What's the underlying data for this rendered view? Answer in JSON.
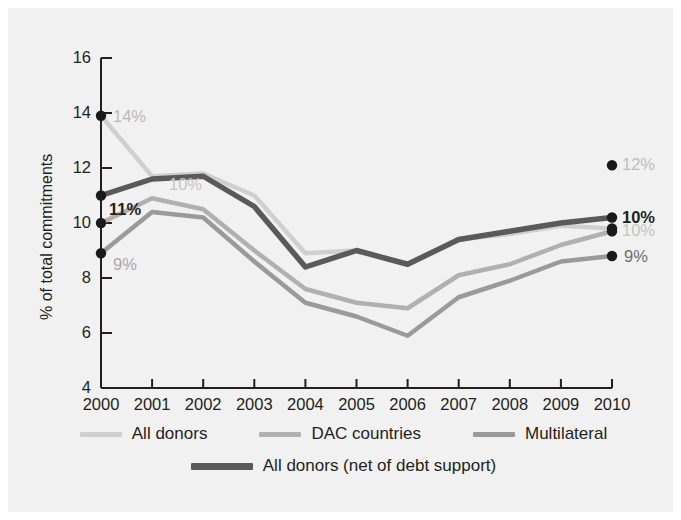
{
  "figure": {
    "background": "#ffffff",
    "panel_background": "#f1f1f1",
    "axis_color": "#231f20",
    "text_color": "#231f20"
  },
  "chart_data": {
    "type": "line",
    "title": "",
    "subtitle": "",
    "xlabel": "",
    "ylabel": "% of total commitments",
    "categories": [
      "2000",
      "2001",
      "2002",
      "2003",
      "2004",
      "2005",
      "2006",
      "2007",
      "2008",
      "2009",
      "2010"
    ],
    "x": [
      2000,
      2001,
      2002,
      2003,
      2004,
      2005,
      2006,
      2007,
      2008,
      2009,
      2010
    ],
    "xlim": [
      2000,
      2010
    ],
    "ylim": [
      4,
      16
    ],
    "yticks": [
      4,
      6,
      8,
      10,
      12,
      14,
      16
    ],
    "ytick_labels": [
      "4",
      "6",
      "8",
      "10",
      "12",
      "14",
      "16"
    ],
    "xticks": [
      2000,
      2001,
      2002,
      2003,
      2004,
      2005,
      2006,
      2007,
      2008,
      2009,
      2010
    ],
    "grid": false,
    "legend_position": "bottom",
    "series": [
      {
        "name": "All donors",
        "color": "#cfcfcf",
        "width": 4.5,
        "values": [
          13.9,
          11.7,
          11.8,
          11.0,
          8.9,
          9.0,
          8.5,
          9.4,
          9.6,
          9.9,
          9.8
        ],
        "start_label": "14%",
        "end_label": "10%",
        "start_marker": true,
        "end_marker": true
      },
      {
        "name": "DAC countries",
        "color": "#b0b0b0",
        "width": 4.5,
        "values": [
          10.0,
          10.9,
          10.5,
          9.0,
          7.6,
          7.1,
          6.9,
          8.1,
          8.5,
          9.2,
          9.7
        ],
        "start_label": "10%",
        "end_label": "10%",
        "start_marker": true,
        "end_marker": true
      },
      {
        "name": "Multilateral",
        "color": "#9a9a9a",
        "width": 4.5,
        "values": [
          8.9,
          10.4,
          10.2,
          8.6,
          7.1,
          6.6,
          5.9,
          7.3,
          7.9,
          8.6,
          8.8
        ],
        "start_label": "9%",
        "end_label": "9%",
        "start_marker": true,
        "end_marker": true
      },
      {
        "name": "All donors (net of debt support)",
        "color": "#5a5a5a",
        "width": 5.5,
        "values": [
          11.0,
          11.6,
          11.7,
          10.6,
          8.4,
          9.0,
          8.5,
          9.4,
          9.7,
          10.0,
          10.2
        ],
        "start_label": "11%",
        "end_label": "10%",
        "start_marker": true,
        "end_marker": true,
        "emphasis": true
      }
    ],
    "multilateral_right_series_note": "",
    "annotations": [
      {
        "text": "14%",
        "series": "All donors",
        "side": "left",
        "color": "#b8b8b8"
      },
      {
        "text": "11%",
        "series": "All donors (net of debt support)",
        "side": "left",
        "color": "#231f20",
        "bold": true
      },
      {
        "text": "10%",
        "series": "All donors",
        "side": "left-mid",
        "color": "#c4c4c4"
      },
      {
        "text": "9%",
        "series": "Multilateral",
        "side": "left",
        "color": "#a8a8a8"
      },
      {
        "text": "12%",
        "series": "Multilateral-right",
        "side": "right",
        "color": "#bdbdbd"
      },
      {
        "text": "10%",
        "series": "All donors (net of debt support)",
        "side": "right",
        "color": "#231f20",
        "bold": true
      },
      {
        "text": "10%",
        "series": "All donors",
        "side": "right",
        "color": "#c4c4c4"
      },
      {
        "text": "9%",
        "series": "DAC countries",
        "side": "right",
        "color": "#6e6e6e"
      }
    ]
  },
  "legend": {
    "row1": [
      {
        "label": "All donors",
        "color": "#cfcfcf"
      },
      {
        "label": "DAC countries",
        "color": "#b0b0b0"
      },
      {
        "label": "Multilateral",
        "color": "#9a9a9a"
      }
    ],
    "row2": [
      {
        "label": "All donors (net of debt support)",
        "color": "#5a5a5a"
      }
    ]
  }
}
